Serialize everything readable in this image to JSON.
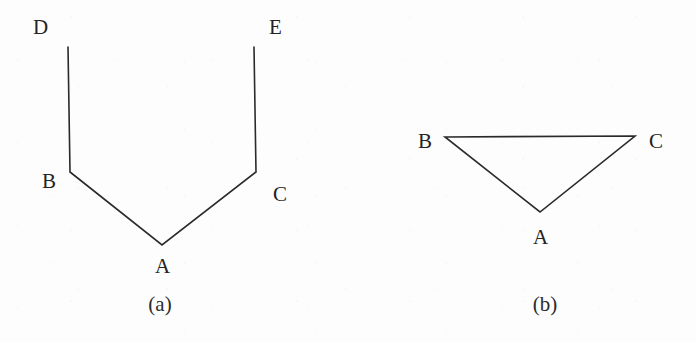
{
  "figure": {
    "background_color": "#fdfdfd",
    "stroke_color": "#2a2a2a",
    "text_color": "#242424",
    "width": 696,
    "height": 342
  },
  "panels": [
    {
      "id": "a",
      "caption": "(a)",
      "caption_x": 160,
      "caption_y": 294,
      "shape_type": "polyline",
      "points": "68,47 70,172 162,245 256,172 254,47",
      "vertices": [
        {
          "name": "D",
          "label": "D",
          "label_x": 33,
          "label_y": 17,
          "point_x": 68,
          "point_y": 47
        },
        {
          "name": "B",
          "label": "B",
          "label_x": 42,
          "label_y": 171,
          "point_x": 70,
          "point_y": 172
        },
        {
          "name": "A",
          "label": "A",
          "label_x": 155,
          "label_y": 256,
          "point_x": 162,
          "point_y": 245
        },
        {
          "name": "C",
          "label": "C",
          "label_x": 273,
          "label_y": 184,
          "point_x": 256,
          "point_y": 172
        },
        {
          "name": "E",
          "label": "E",
          "label_x": 269,
          "label_y": 17,
          "point_x": 254,
          "point_y": 47
        }
      ],
      "edges": [
        "D-B",
        "B-A",
        "A-C",
        "C-E"
      ]
    },
    {
      "id": "b",
      "caption": "(b)",
      "caption_x": 545,
      "caption_y": 294,
      "shape_type": "polygon",
      "points": "97,137 287,136 192,212",
      "vertices": [
        {
          "name": "B",
          "label": "B",
          "label_x": 418,
          "label_y": 131,
          "point_x": 445,
          "point_y": 137
        },
        {
          "name": "C",
          "label": "C",
          "label_x": 649,
          "label_y": 131,
          "point_x": 635,
          "point_y": 136
        },
        {
          "name": "A",
          "label": "A",
          "label_x": 533,
          "label_y": 227,
          "point_x": 540,
          "point_y": 212
        }
      ],
      "edges": [
        "B-C",
        "C-A",
        "A-B"
      ]
    }
  ]
}
